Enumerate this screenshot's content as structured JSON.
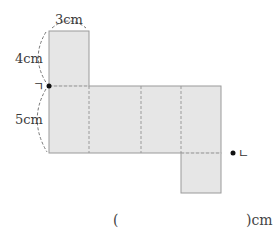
{
  "diagram": {
    "type": "net-of-rectangular-prism",
    "labels": {
      "top_width": "3cm",
      "top_height": "4cm",
      "middle_height": "5cm"
    },
    "points": {
      "left_point": "ㄱ",
      "right_point": "ㄴ"
    },
    "colors": {
      "face_fill": "#e6e6e6",
      "face_stroke": "#9a9a9a",
      "fold_line": "#9a9a9a",
      "point": "#111111"
    }
  },
  "answer": {
    "open_paren": "(",
    "close_paren_unit": ")cm"
  }
}
